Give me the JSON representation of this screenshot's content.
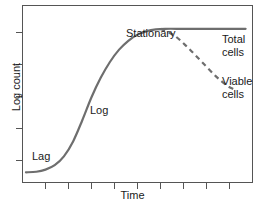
{
  "chart_data": {
    "type": "line",
    "title": "",
    "xlabel": "Time",
    "ylabel": "Log count",
    "xlim": [
      0,
      10
    ],
    "ylim": [
      0,
      10
    ],
    "grid": false,
    "legend_position": "right-inline",
    "x_ticks": [
      1,
      2,
      3,
      4,
      5,
      6,
      7,
      8,
      9
    ],
    "x_tick_labels": [],
    "y_ticks": [
      2,
      4,
      6,
      8
    ],
    "y_tick_labels": [],
    "annotations": [
      {
        "text": "Lag",
        "x": 0.6,
        "y": 1.6
      },
      {
        "text": "Log",
        "x": 3.4,
        "y": 4.6
      },
      {
        "text": "Stationary",
        "x": 5.5,
        "y": 9.4
      }
    ],
    "series": [
      {
        "name": "Total cells",
        "style": "solid",
        "color": "#6e6e6e",
        "points": [
          [
            0.15,
            0.55
          ],
          [
            0.6,
            0.58
          ],
          [
            1.0,
            0.7
          ],
          [
            1.4,
            0.95
          ],
          [
            1.8,
            1.45
          ],
          [
            2.2,
            2.3
          ],
          [
            2.6,
            3.5
          ],
          [
            3.0,
            4.8
          ],
          [
            3.4,
            5.9
          ],
          [
            3.8,
            6.8
          ],
          [
            4.2,
            7.5
          ],
          [
            4.6,
            8.0
          ],
          [
            5.0,
            8.35
          ],
          [
            5.4,
            8.55
          ],
          [
            5.8,
            8.65
          ],
          [
            6.2,
            8.68
          ],
          [
            7.0,
            8.68
          ],
          [
            8.0,
            8.68
          ],
          [
            9.0,
            8.68
          ],
          [
            9.7,
            8.68
          ]
        ]
      },
      {
        "name": "Viable cells",
        "style": "dashed",
        "color": "#6e6e6e",
        "points": [
          [
            6.0,
            8.68
          ],
          [
            6.6,
            8.3
          ],
          [
            7.2,
            7.6
          ],
          [
            7.8,
            6.8
          ],
          [
            8.4,
            6.0
          ],
          [
            8.9,
            5.45
          ],
          [
            9.2,
            5.25
          ]
        ]
      }
    ],
    "legend_labels": [
      {
        "name": "Total cells",
        "line1": "Total",
        "line2": "cells"
      },
      {
        "name": "Viable cells",
        "line1": "Viable",
        "line2": "cells"
      }
    ]
  },
  "colors": {
    "curve": "#6e6e6e",
    "axis": "#555555",
    "text": "#1a1a1a",
    "background": "#ffffff"
  }
}
